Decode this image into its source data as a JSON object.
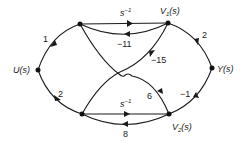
{
  "diagram": {
    "type": "signal-flow-graph",
    "nodes": [
      {
        "id": "U",
        "label": "U(s)",
        "label_main": "U",
        "label_arg": "(s)",
        "x": 38,
        "y": 70
      },
      {
        "id": "A",
        "label": "",
        "x": 80,
        "y": 24
      },
      {
        "id": "B",
        "label": "",
        "x": 82,
        "y": 114
      },
      {
        "id": "V1",
        "label": "V1(s)",
        "label_main": "V",
        "label_sub": "1",
        "label_arg": "(s)",
        "x": 168,
        "y": 23
      },
      {
        "id": "V2",
        "label": "V2(s)",
        "label_main": "V",
        "label_sub": "2",
        "label_arg": "(s)",
        "x": 169,
        "y": 114
      },
      {
        "id": "Y",
        "label": "Y(s)",
        "label_main": "Y",
        "label_arg": "(s)",
        "x": 212,
        "y": 68
      }
    ],
    "edges": [
      {
        "from": "U",
        "to": "A",
        "gain": "1"
      },
      {
        "from": "U",
        "to": "B",
        "gain": "2"
      },
      {
        "from": "A",
        "to": "V1",
        "gain": "s^-1",
        "gain_base": "s",
        "gain_exp": "−1"
      },
      {
        "from": "V1",
        "to": "A",
        "gain": "-11",
        "gain_text": "−11"
      },
      {
        "from": "V1",
        "to": "B",
        "gain": "-15",
        "gain_text": "−15"
      },
      {
        "from": "B",
        "to": "V2",
        "gain": "s^-1",
        "gain_base": "s",
        "gain_exp": "−1"
      },
      {
        "from": "V2",
        "to": "B",
        "gain": "8",
        "gain_text": "8"
      },
      {
        "from": "V2",
        "to": "A",
        "gain": "6",
        "gain_text": "6"
      },
      {
        "from": "V1",
        "to": "Y",
        "gain": "2",
        "gain_text": "2"
      },
      {
        "from": "V2",
        "to": "Y",
        "gain": "-1",
        "gain_text": "−1"
      }
    ]
  }
}
